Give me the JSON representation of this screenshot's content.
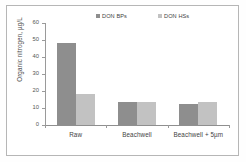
{
  "chart_data": {
    "type": "bar",
    "title": "",
    "xlabel": "",
    "ylabel": "Organic nitrogen, µg/L",
    "categories": [
      "Raw",
      "Beachwell",
      "Beachwell + 5µm"
    ],
    "series": [
      {
        "name": "DON BPs",
        "values": [
          48,
          13.5,
          12.5
        ],
        "color": "#8e8e8e"
      },
      {
        "name": "DON HSs",
        "values": [
          18,
          13.5,
          13.5
        ],
        "color": "#c2c2c2"
      }
    ],
    "ylim": [
      0,
      60
    ],
    "yticks": [
      0,
      10,
      20,
      30,
      40,
      50,
      60
    ],
    "ytick_labels": [
      "0",
      "10",
      "20",
      "30",
      "40",
      "50",
      "60"
    ],
    "grid": false,
    "legend_position": "top-center"
  }
}
